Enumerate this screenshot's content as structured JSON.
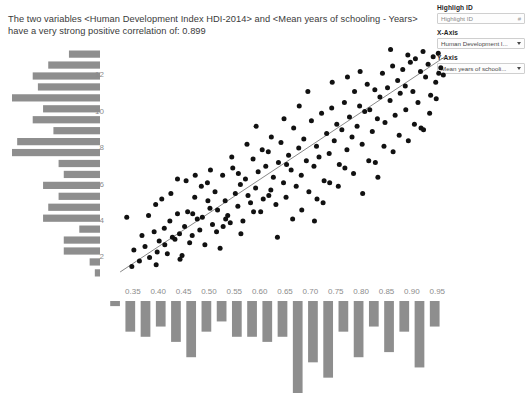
{
  "statement": {
    "text": "The two variables <Human Development Index HDI-2014> and <Mean years of schooling - Years> have a very strong positive correlation of: 0.899"
  },
  "controls": {
    "highlight": {
      "label": "Highligh ID",
      "placeholder": "Highlight ID",
      "value": "Highlight ID",
      "adorn": "#"
    },
    "x_axis": {
      "label": "X-Axis",
      "value": "Human Development I...",
      "caret": "chevron-down-icon"
    },
    "y_axis": {
      "label": "Y-Axis",
      "value": "Mean years of schooli...",
      "caret": "chevron-down-icon"
    }
  },
  "chart_data": {
    "type": "scatter",
    "title": "",
    "xlabel": "Human Development Index HDI-2014",
    "ylabel": "Mean years of schooling - Years",
    "correlation": 0.899,
    "xlim": [
      0.305,
      0.985
    ],
    "ylim": [
      0.6,
      13.6
    ],
    "xticks": [
      0.35,
      0.4,
      0.45,
      0.5,
      0.55,
      0.6,
      0.65,
      0.7,
      0.75,
      0.8,
      0.85,
      0.9,
      0.95
    ],
    "xtick_labels": [
      "0.35",
      "0.40",
      "0.45",
      "0.50",
      "0.55",
      "0.60",
      "0.65",
      "0.70",
      "0.75",
      "0.80",
      "0.85",
      "0.90",
      "0.95"
    ],
    "yticks": [
      2,
      4,
      6,
      8,
      10,
      12
    ],
    "ytick_labels": [
      "2",
      "4",
      "6",
      "8",
      "10",
      "12"
    ],
    "grid": false,
    "legend": "none",
    "trendline": {
      "x0": 0.325,
      "y0": 1.15,
      "x1": 0.965,
      "y1": 12.95
    },
    "points": [
      [
        0.348,
        1.45
      ],
      [
        0.352,
        2.35
      ],
      [
        0.363,
        1.75
      ],
      [
        0.374,
        2.55
      ],
      [
        0.381,
        4.25
      ],
      [
        0.392,
        3.35
      ],
      [
        0.396,
        1.55
      ],
      [
        0.402,
        2.85
      ],
      [
        0.407,
        5.15
      ],
      [
        0.412,
        3.55
      ],
      [
        0.418,
        2.15
      ],
      [
        0.423,
        3.95
      ],
      [
        0.428,
        3.05
      ],
      [
        0.433,
        2.95
      ],
      [
        0.438,
        4.35
      ],
      [
        0.442,
        3.25
      ],
      [
        0.447,
        2.05
      ],
      [
        0.452,
        3.65
      ],
      [
        0.458,
        4.45
      ],
      [
        0.462,
        2.75
      ],
      [
        0.467,
        3.15
      ],
      [
        0.472,
        5.25
      ],
      [
        0.477,
        4.05
      ],
      [
        0.482,
        3.45
      ],
      [
        0.487,
        4.15
      ],
      [
        0.492,
        2.65
      ],
      [
        0.497,
        6.05
      ],
      [
        0.502,
        4.65
      ],
      [
        0.507,
        3.75
      ],
      [
        0.512,
        5.55
      ],
      [
        0.517,
        4.55
      ],
      [
        0.522,
        2.45
      ],
      [
        0.527,
        6.45
      ],
      [
        0.532,
        5.05
      ],
      [
        0.537,
        4.25
      ],
      [
        0.542,
        3.85
      ],
      [
        0.547,
        6.85
      ],
      [
        0.552,
        5.45
      ],
      [
        0.557,
        4.75
      ],
      [
        0.562,
        5.95
      ],
      [
        0.567,
        3.95
      ],
      [
        0.572,
        6.25
      ],
      [
        0.577,
        5.35
      ],
      [
        0.582,
        4.95
      ],
      [
        0.587,
        7.35
      ],
      [
        0.592,
        5.75
      ],
      [
        0.597,
        6.65
      ],
      [
        0.602,
        4.45
      ],
      [
        0.607,
        5.15
      ],
      [
        0.612,
        6.95
      ],
      [
        0.617,
        7.75
      ],
      [
        0.622,
        5.65
      ],
      [
        0.627,
        6.35
      ],
      [
        0.632,
        4.85
      ],
      [
        0.637,
        7.15
      ],
      [
        0.642,
        8.25
      ],
      [
        0.647,
        6.05
      ],
      [
        0.652,
        5.25
      ],
      [
        0.657,
        7.55
      ],
      [
        0.662,
        6.75
      ],
      [
        0.667,
        9.05
      ],
      [
        0.672,
        5.85
      ],
      [
        0.677,
        7.95
      ],
      [
        0.682,
        6.45
      ],
      [
        0.687,
        8.45
      ],
      [
        0.692,
        7.25
      ],
      [
        0.697,
        5.55
      ],
      [
        0.702,
        9.45
      ],
      [
        0.707,
        6.95
      ],
      [
        0.712,
        8.05
      ],
      [
        0.717,
        7.45
      ],
      [
        0.722,
        9.85
      ],
      [
        0.727,
        6.15
      ],
      [
        0.732,
        8.75
      ],
      [
        0.737,
        7.65
      ],
      [
        0.742,
        10.15
      ],
      [
        0.747,
        8.35
      ],
      [
        0.752,
        9.25
      ],
      [
        0.757,
        7.05
      ],
      [
        0.762,
        8.95
      ],
      [
        0.767,
        10.45
      ],
      [
        0.772,
        7.85
      ],
      [
        0.777,
        9.65
      ],
      [
        0.782,
        8.55
      ],
      [
        0.787,
        11.05
      ],
      [
        0.792,
        9.15
      ],
      [
        0.797,
        10.25
      ],
      [
        0.802,
        8.15
      ],
      [
        0.807,
        9.95
      ],
      [
        0.812,
        11.45
      ],
      [
        0.817,
        10.05
      ],
      [
        0.822,
        8.85
      ],
      [
        0.827,
        11.15
      ],
      [
        0.832,
        9.55
      ],
      [
        0.837,
        10.75
      ],
      [
        0.842,
        12.05
      ],
      [
        0.847,
        9.35
      ],
      [
        0.852,
        11.25
      ],
      [
        0.857,
        10.55
      ],
      [
        0.862,
        12.45
      ],
      [
        0.867,
        9.75
      ],
      [
        0.872,
        11.65
      ],
      [
        0.877,
        10.95
      ],
      [
        0.882,
        12.25
      ],
      [
        0.887,
        11.35
      ],
      [
        0.892,
        13.05
      ],
      [
        0.897,
        12.65
      ],
      [
        0.902,
        11.05
      ],
      [
        0.907,
        12.85
      ],
      [
        0.912,
        10.45
      ],
      [
        0.917,
        12.15
      ],
      [
        0.922,
        13.25
      ],
      [
        0.927,
        11.85
      ],
      [
        0.932,
        12.55
      ],
      [
        0.937,
        10.85
      ],
      [
        0.942,
        12.95
      ],
      [
        0.947,
        11.55
      ],
      [
        0.952,
        13.15
      ],
      [
        0.957,
        12.35
      ],
      [
        0.962,
        11.95
      ],
      [
        0.338,
        4.15
      ],
      [
        0.395,
        4.85
      ],
      [
        0.425,
        5.45
      ],
      [
        0.455,
        6.15
      ],
      [
        0.485,
        5.85
      ],
      [
        0.515,
        3.35
      ],
      [
        0.545,
        7.45
      ],
      [
        0.575,
        8.15
      ],
      [
        0.605,
        7.85
      ],
      [
        0.635,
        3.05
      ],
      [
        0.665,
        4.05
      ],
      [
        0.695,
        11.05
      ],
      [
        0.725,
        4.95
      ],
      [
        0.755,
        5.85
      ],
      [
        0.785,
        6.55
      ],
      [
        0.815,
        7.25
      ],
      [
        0.845,
        8.05
      ],
      [
        0.875,
        8.65
      ],
      [
        0.905,
        9.25
      ],
      [
        0.935,
        9.85
      ],
      [
        0.368,
        3.15
      ],
      [
        0.398,
        2.25
      ],
      [
        0.438,
        6.25
      ],
      [
        0.468,
        4.35
      ],
      [
        0.498,
        5.05
      ],
      [
        0.528,
        3.65
      ],
      [
        0.558,
        6.55
      ],
      [
        0.588,
        4.45
      ],
      [
        0.618,
        5.35
      ],
      [
        0.648,
        9.55
      ],
      [
        0.678,
        10.25
      ],
      [
        0.708,
        3.95
      ],
      [
        0.738,
        6.05
      ],
      [
        0.768,
        6.85
      ],
      [
        0.798,
        12.15
      ],
      [
        0.828,
        7.15
      ],
      [
        0.858,
        13.35
      ],
      [
        0.888,
        10.05
      ],
      [
        0.918,
        9.05
      ],
      [
        0.948,
        10.65
      ],
      [
        0.383,
        1.95
      ],
      [
        0.413,
        2.65
      ],
      [
        0.443,
        1.85
      ],
      [
        0.473,
        6.45
      ],
      [
        0.503,
        6.75
      ],
      [
        0.533,
        4.05
      ],
      [
        0.563,
        3.25
      ],
      [
        0.593,
        9.15
      ],
      [
        0.623,
        8.55
      ],
      [
        0.653,
        7.05
      ],
      [
        0.683,
        4.55
      ],
      [
        0.713,
        5.15
      ],
      [
        0.743,
        11.55
      ],
      [
        0.773,
        11.85
      ],
      [
        0.803,
        5.45
      ],
      [
        0.833,
        6.35
      ],
      [
        0.863,
        7.75
      ],
      [
        0.893,
        8.35
      ],
      [
        0.923,
        8.95
      ],
      [
        0.953,
        12.05
      ]
    ],
    "x_histogram": {
      "orientation": "vertical",
      "bin_centers": [
        0.315,
        0.345,
        0.375,
        0.405,
        0.435,
        0.465,
        0.495,
        0.525,
        0.555,
        0.585,
        0.615,
        0.645,
        0.675,
        0.705,
        0.735,
        0.765,
        0.795,
        0.825,
        0.855,
        0.885,
        0.915,
        0.945
      ],
      "counts": [
        1,
        6,
        7,
        5,
        8,
        11,
        6,
        4,
        7,
        7,
        8,
        7,
        18,
        12,
        15,
        6,
        11,
        5,
        10,
        6,
        13,
        5
      ]
    },
    "y_histogram": {
      "orientation": "horizontal",
      "bin_centers": [
        13.1,
        12.5,
        11.9,
        11.3,
        10.7,
        10.1,
        9.5,
        8.9,
        8.3,
        7.7,
        7.1,
        6.5,
        5.9,
        5.3,
        4.7,
        4.1,
        3.5,
        2.9,
        2.3,
        1.7,
        1.1
      ],
      "counts": [
        6,
        10,
        13,
        12,
        17,
        11,
        13,
        9,
        16,
        17,
        8,
        7,
        11,
        8,
        10,
        11,
        4,
        7,
        7,
        2,
        1
      ]
    }
  }
}
